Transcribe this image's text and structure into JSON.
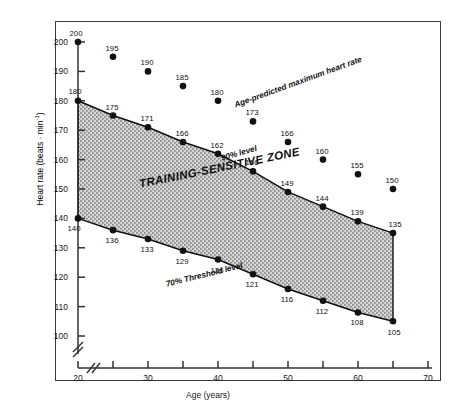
{
  "chart_data": {
    "type": "scatter",
    "title": "",
    "xlabel": "Age (years)",
    "ylabel_text": "Heart rate (beats",
    "ylabel_unit": "min",
    "ylabel_exp": "-1",
    "ylabel_full": "Heart rate (beats · min⁻¹)",
    "x": [
      20,
      25,
      30,
      35,
      40,
      45,
      50,
      55,
      60,
      65
    ],
    "xlim": [
      18,
      70
    ],
    "ylim": [
      95,
      203
    ],
    "xticks_major": [
      20,
      30,
      40,
      50,
      60,
      70
    ],
    "xticks_minor": [
      25,
      35,
      45,
      55,
      65
    ],
    "xtick_labels": [
      "20",
      "30",
      "40",
      "50",
      "60",
      "70"
    ],
    "yticks": [
      100,
      110,
      120,
      130,
      140,
      150,
      160,
      170,
      180,
      190,
      200
    ],
    "ytick_labels": [
      "100",
      "110",
      "120",
      "130",
      "140",
      "150",
      "160",
      "170",
      "180",
      "190",
      "200"
    ],
    "grid": false,
    "axis_break_x": true,
    "axis_break_y": true,
    "legend_position": "none",
    "series": [
      {
        "name": "Age-predicted maximum heart rate",
        "marker": "filled-circle",
        "line": false,
        "values": [
          200,
          195,
          190,
          185,
          180,
          173,
          166,
          160,
          155,
          150
        ],
        "labels": [
          "200",
          "195",
          "190",
          "185",
          "180",
          "173",
          "166",
          "160",
          "155",
          "150"
        ]
      },
      {
        "name": "90% level",
        "marker": "filled-circle",
        "line": true,
        "values": [
          180,
          175,
          171,
          166,
          162,
          156,
          149,
          144,
          139,
          135
        ],
        "labels": [
          "180",
          "175",
          "171",
          "166",
          "162",
          "156",
          "149",
          "144",
          "139",
          "135"
        ]
      },
      {
        "name": "70% Threshold level",
        "marker": "filled-circle",
        "line": true,
        "values": [
          140,
          136,
          133,
          129,
          126,
          121,
          116,
          112,
          108,
          105
        ],
        "labels": [
          "140",
          "136",
          "133",
          "129",
          "126",
          "121",
          "116",
          "112",
          "108",
          "105"
        ]
      }
    ],
    "shaded_region": {
      "label": "TRAINING-SENSITIVE ZONE",
      "between": [
        "90% level",
        "70% Threshold level"
      ],
      "fill": "#b9b9b9"
    },
    "annotations": [
      {
        "text": "Age-predicted maximum heart rate",
        "rotation": -20
      },
      {
        "text": "90% level",
        "rotation": -16
      },
      {
        "text": "70% Threshold level",
        "rotation": -14
      },
      {
        "text": "TRAINING-SENSITIVE ZONE",
        "rotation": -11.5
      }
    ],
    "colors": {
      "marker": "#111111",
      "line": "#111111",
      "axis": "#333333",
      "shade": "#b9b9b9",
      "frame": "#3a3a3a",
      "background": "#ffffff"
    }
  }
}
